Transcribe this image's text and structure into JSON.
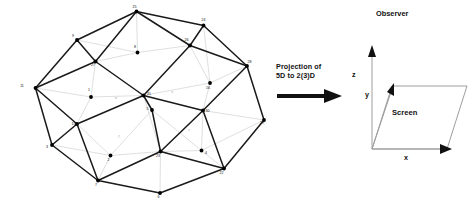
{
  "caption": {
    "line1": "Projection of",
    "line2": "5D to 2(3)D",
    "arrow_icon": "right-arrow-icon"
  },
  "observer_panel": {
    "title": "Observer",
    "screen_label": "Screen",
    "axes": [
      {
        "name": "z",
        "label": "z"
      },
      {
        "name": "y",
        "label": "y"
      },
      {
        "name": "x",
        "label": "x"
      }
    ]
  },
  "projection_graph": {
    "title": "",
    "vertices": [
      {
        "id": "v25",
        "label": "25",
        "x": 136.5,
        "y": 11.5,
        "lx": 134.5,
        "ly": 7.5,
        "solid": true
      },
      {
        "id": "v9",
        "label": "9",
        "x": 77.0,
        "y": 40.0,
        "lx": 73.0,
        "ly": 36.5,
        "solid": true
      },
      {
        "id": "v24",
        "label": "24",
        "x": 203.5,
        "y": 25.5,
        "lx": 203.5,
        "ly": 21.0,
        "solid": true
      },
      {
        "id": "v26",
        "label": "26",
        "x": 190.0,
        "y": 45.5,
        "lx": 186.5,
        "ly": 41.0,
        "solid": true
      },
      {
        "id": "v8",
        "label": "8",
        "x": 137.5,
        "y": 52.5,
        "lx": 135.0,
        "ly": 48.0,
        "solid": true
      },
      {
        "id": "v27",
        "label": "27",
        "x": 95.5,
        "y": 61.5,
        "lx": 93.0,
        "ly": 66.0,
        "solid": true
      },
      {
        "id": "v28",
        "label": "28",
        "x": 247.0,
        "y": 66.0,
        "lx": 249.5,
        "ly": 63.0,
        "solid": true
      },
      {
        "id": "v11",
        "label": "11",
        "x": 35.5,
        "y": 88.0,
        "lx": 22.0,
        "ly": 87.0,
        "solid": true
      },
      {
        "id": "v1",
        "label": "1",
        "x": 91.0,
        "y": 97.0,
        "lx": 89.0,
        "ly": 91.0,
        "solid": true
      },
      {
        "id": "v31",
        "label": "31",
        "x": 143.5,
        "y": 95.5,
        "lx": 149.0,
        "ly": 94.5,
        "solid": true
      },
      {
        "id": "v16",
        "label": "16",
        "x": 210.0,
        "y": 83.0,
        "lx": 208.0,
        "ly": 89.0,
        "solid": true
      },
      {
        "id": "v30",
        "label": "30",
        "x": 203.0,
        "y": 110.5,
        "lx": 207.5,
        "ly": 111.5,
        "solid": true
      },
      {
        "id": "v29",
        "label": "29",
        "x": 264.0,
        "y": 120.0,
        "lx": 262.0,
        "ly": 123.5,
        "solid": true
      },
      {
        "id": "v15",
        "label": "15",
        "x": 77.0,
        "y": 124.0,
        "lx": 73.5,
        "ly": 124.5,
        "solid": true
      },
      {
        "id": "v3",
        "label": "3",
        "x": 52.0,
        "y": 145.0,
        "lx": 47.0,
        "ly": 148.0,
        "solid": true
      },
      {
        "id": "v5",
        "label": "5",
        "x": 152.0,
        "y": 110.0,
        "lx": 147.5,
        "ly": 109.5,
        "solid": true
      },
      {
        "id": "v2",
        "label": "2",
        "x": 110.5,
        "y": 155.5,
        "lx": 108.5,
        "ly": 160.5,
        "solid": true
      },
      {
        "id": "v23",
        "label": "23",
        "x": 160.5,
        "y": 151.5,
        "lx": 158.0,
        "ly": 157.0,
        "solid": true
      },
      {
        "id": "v4",
        "label": "4",
        "x": 201.5,
        "y": 150.5,
        "lx": 206.0,
        "ly": 153.5,
        "solid": true
      },
      {
        "id": "v22",
        "label": "22",
        "x": 224.0,
        "y": 168.5,
        "lx": 221.5,
        "ly": 173.5,
        "solid": true
      },
      {
        "id": "v7",
        "label": "7",
        "x": 98.0,
        "y": 180.5,
        "lx": 96.0,
        "ly": 185.5,
        "solid": true
      },
      {
        "id": "v6",
        "label": "6",
        "x": 160.0,
        "y": 193.0,
        "lx": 158.5,
        "ly": 198.0,
        "solid": true
      }
    ],
    "cell_labels": [
      {
        "label": "w",
        "x": 116.0,
        "y": 98.5
      },
      {
        "label": "x",
        "x": 172.0,
        "y": 93.0
      },
      {
        "label": "y",
        "x": 119.0,
        "y": 137.0
      },
      {
        "label": "z",
        "x": 189.0,
        "y": 131.0
      }
    ],
    "dark_edges": [
      [
        "v25",
        "v9"
      ],
      [
        "v25",
        "v24"
      ],
      [
        "v25",
        "v27"
      ],
      [
        "v25",
        "v26"
      ],
      [
        "v9",
        "v11"
      ],
      [
        "v9",
        "v27"
      ],
      [
        "v24",
        "v26"
      ],
      [
        "v24",
        "v28"
      ],
      [
        "v26",
        "v28"
      ],
      [
        "v26",
        "v31"
      ],
      [
        "v27",
        "v11"
      ],
      [
        "v27",
        "v31"
      ],
      [
        "v28",
        "v30"
      ],
      [
        "v28",
        "v29"
      ],
      [
        "v11",
        "v15"
      ],
      [
        "v11",
        "v3"
      ],
      [
        "v31",
        "v15"
      ],
      [
        "v31",
        "v30"
      ],
      [
        "v31",
        "v5"
      ],
      [
        "v30",
        "v22"
      ],
      [
        "v30",
        "v23"
      ],
      [
        "v29",
        "v22"
      ],
      [
        "v15",
        "v7"
      ],
      [
        "v15",
        "v3"
      ],
      [
        "v3",
        "v7"
      ],
      [
        "v5",
        "v23"
      ],
      [
        "v23",
        "v22"
      ],
      [
        "v23",
        "v7"
      ],
      [
        "v7",
        "v6"
      ],
      [
        "v6",
        "v22"
      ]
    ],
    "light_edges": [
      [
        "v9",
        "v8"
      ],
      [
        "v8",
        "v25"
      ],
      [
        "v8",
        "v26"
      ],
      [
        "v8",
        "v27"
      ],
      [
        "v27",
        "v1"
      ],
      [
        "v1",
        "v31"
      ],
      [
        "v1",
        "v15"
      ],
      [
        "v1",
        "v11"
      ],
      [
        "v26",
        "v16"
      ],
      [
        "v16",
        "v31"
      ],
      [
        "v16",
        "v28"
      ],
      [
        "v16",
        "v30"
      ],
      [
        "v31",
        "v23"
      ],
      [
        "v5",
        "v31"
      ],
      [
        "v5",
        "v2"
      ],
      [
        "v5",
        "v4"
      ],
      [
        "v2",
        "v15"
      ],
      [
        "v2",
        "v7"
      ],
      [
        "v2",
        "v23"
      ],
      [
        "v4",
        "v30"
      ],
      [
        "v4",
        "v23"
      ],
      [
        "v4",
        "v22"
      ],
      [
        "v4",
        "v29"
      ],
      [
        "v29",
        "v30"
      ],
      [
        "v23",
        "v6"
      ],
      [
        "v3",
        "v2"
      ],
      [
        "v24",
        "v16"
      ]
    ]
  }
}
